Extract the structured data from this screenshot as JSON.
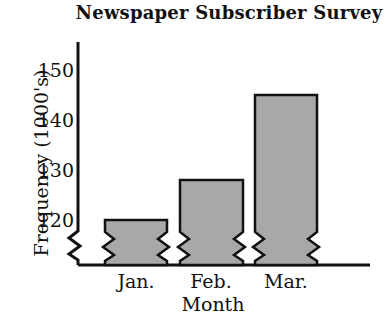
{
  "chart_data": {
    "type": "bar",
    "title": "Newspaper Subscriber Survey",
    "xlabel": "Month",
    "ylabel": "Frequency (1000's)",
    "categories": [
      "Jan.",
      "Feb.",
      "Mar."
    ],
    "values": [
      120,
      128,
      145
    ],
    "yticks": [
      120,
      130,
      140,
      150
    ],
    "ylim": [
      120,
      152
    ],
    "axis_break": true,
    "grid": false,
    "legend": "none",
    "bar_fill_color": "#a8a8a8",
    "bar_edge_color": "#111111"
  }
}
